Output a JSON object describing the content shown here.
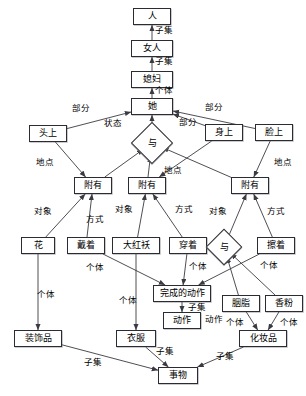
{
  "diagram": {
    "type": "semantic-network",
    "canvas": {
      "width": 306,
      "height": 396
    },
    "style": {
      "node_fill": "#ffffff",
      "node_stroke": "#2b2b33",
      "edge_stroke": "#3a3a42",
      "text_color": "#000000"
    },
    "nodes": [
      {
        "id": "ren",
        "label": "人",
        "shape": "rect",
        "x": 133,
        "y": 8,
        "w": 38,
        "h": 17
      },
      {
        "id": "nvren",
        "label": "女人",
        "shape": "rect",
        "x": 131,
        "y": 40,
        "w": 42,
        "h": 17
      },
      {
        "id": "xifu",
        "label": "媳妇",
        "shape": "rect",
        "x": 131,
        "y": 71,
        "w": 42,
        "h": 17
      },
      {
        "id": "ta",
        "label": "她",
        "shape": "rect",
        "x": 131,
        "y": 98,
        "w": 42,
        "h": 17
      },
      {
        "id": "touting",
        "label": "头上",
        "shape": "rect",
        "x": 29,
        "y": 125,
        "w": 38,
        "h": 17
      },
      {
        "id": "shenshang",
        "label": "身上",
        "shape": "rect",
        "x": 205,
        "y": 124,
        "w": 38,
        "h": 17
      },
      {
        "id": "lianshang",
        "label": "脸上",
        "shape": "rect",
        "x": 255,
        "y": 124,
        "w": 38,
        "h": 17
      },
      {
        "id": "yu1",
        "label": "与",
        "shape": "diamond",
        "x": 137,
        "y": 128,
        "w": 30,
        "h": 30
      },
      {
        "id": "fuyou1",
        "label": "附有",
        "shape": "rect",
        "x": 74,
        "y": 177,
        "w": 38,
        "h": 17
      },
      {
        "id": "fuyou2",
        "label": "附有",
        "shape": "rect",
        "x": 128,
        "y": 177,
        "w": 38,
        "h": 17
      },
      {
        "id": "fuyou3",
        "label": "附有",
        "shape": "rect",
        "x": 231,
        "y": 177,
        "w": 38,
        "h": 17
      },
      {
        "id": "hua",
        "label": "花",
        "shape": "rect",
        "x": 21,
        "y": 237,
        "w": 34,
        "h": 17
      },
      {
        "id": "daizhe",
        "label": "戴着",
        "shape": "rect",
        "x": 67,
        "y": 237,
        "w": 38,
        "h": 17
      },
      {
        "id": "dahongao",
        "label": "大红袄",
        "shape": "rect",
        "x": 112,
        "y": 237,
        "w": 48,
        "h": 17
      },
      {
        "id": "chuanzhe",
        "label": "穿着",
        "shape": "rect",
        "x": 169,
        "y": 237,
        "w": 38,
        "h": 17
      },
      {
        "id": "yu2",
        "label": "与",
        "shape": "diamond",
        "x": 211,
        "y": 234,
        "w": 26,
        "h": 26
      },
      {
        "id": "cazhe",
        "label": "擦着",
        "shape": "rect",
        "x": 257,
        "y": 237,
        "w": 38,
        "h": 17
      },
      {
        "id": "wanchengdongzuo",
        "label": "完成的动作",
        "shape": "rect",
        "x": 153,
        "y": 285,
        "w": 58,
        "h": 17
      },
      {
        "id": "yanzhi",
        "label": "胭脂",
        "shape": "rect",
        "x": 222,
        "y": 295,
        "w": 38,
        "h": 17
      },
      {
        "id": "xiangfen",
        "label": "香粉",
        "shape": "rect",
        "x": 265,
        "y": 295,
        "w": 38,
        "h": 17
      },
      {
        "id": "dongzuo",
        "label": "动作",
        "shape": "rect",
        "x": 163,
        "y": 312,
        "w": 38,
        "h": 17
      },
      {
        "id": "zhuangshipin",
        "label": "装饰品",
        "shape": "rect",
        "x": 14,
        "y": 330,
        "w": 48,
        "h": 17
      },
      {
        "id": "yifu",
        "label": "衣服",
        "shape": "rect",
        "x": 116,
        "y": 330,
        "w": 40,
        "h": 17
      },
      {
        "id": "huazhuangpin",
        "label": "化妆品",
        "shape": "rect",
        "x": 239,
        "y": 330,
        "w": 48,
        "h": 17
      },
      {
        "id": "shiwu",
        "label": "事物",
        "shape": "rect",
        "x": 158,
        "y": 367,
        "w": 40,
        "h": 17
      }
    ],
    "edges": [
      {
        "from": "nvren",
        "to": "ren",
        "label": "子集"
      },
      {
        "from": "xifu",
        "to": "nvren",
        "label": "子集"
      },
      {
        "from": "ta",
        "to": "xifu",
        "label": "个体"
      },
      {
        "from": "touting",
        "to": "ta",
        "label": "部分"
      },
      {
        "from": "shenshang",
        "to": "ta",
        "label": "部分"
      },
      {
        "from": "lianshang",
        "to": "ta",
        "label": "部分"
      },
      {
        "from": "yu1",
        "to": "ta",
        "label": "状态"
      },
      {
        "from": "fuyou1",
        "to": "yu1",
        "label": ""
      },
      {
        "from": "fuyou2",
        "to": "yu1",
        "label": ""
      },
      {
        "from": "fuyou3",
        "to": "yu1",
        "label": ""
      },
      {
        "from": "touting",
        "to": "fuyou1",
        "label": "地点"
      },
      {
        "from": "shenshang",
        "to": "fuyou2",
        "label": "地点"
      },
      {
        "from": "lianshang",
        "to": "fuyou3",
        "label": "地点"
      },
      {
        "from": "hua",
        "to": "fuyou1",
        "label": "对象"
      },
      {
        "from": "daizhe",
        "to": "fuyou1",
        "label": "方式"
      },
      {
        "from": "dahongao",
        "to": "fuyou2",
        "label": "对象"
      },
      {
        "from": "chuanzhe",
        "to": "fuyou2",
        "label": "方式"
      },
      {
        "from": "yu2",
        "to": "fuyou3",
        "label": "对象"
      },
      {
        "from": "cazhe",
        "to": "fuyou3",
        "label": "方式"
      },
      {
        "from": "hua",
        "to": "zhuangshipin",
        "label": "个体"
      },
      {
        "from": "daizhe",
        "to": "wanchengdongzuo",
        "label": "个体"
      },
      {
        "from": "dahongao",
        "to": "yifu",
        "label": "个体"
      },
      {
        "from": "chuanzhe",
        "to": "wanchengdongzuo",
        "label": "个体"
      },
      {
        "from": "cazhe",
        "to": "wanchengdongzuo",
        "label": "个体"
      },
      {
        "from": "yanzhi",
        "to": "yu2",
        "label": "个体"
      },
      {
        "from": "xiangfen",
        "to": "yu2",
        "label": "个体"
      },
      {
        "from": "yanzhi",
        "to": "huazhuangpin",
        "label": "个体"
      },
      {
        "from": "xiangfen",
        "to": "huazhuangpin",
        "label": "个体"
      },
      {
        "from": "wanchengdongzuo",
        "to": "dongzuo",
        "label": "子集"
      },
      {
        "from": "zhuangshipin",
        "to": "shiwu",
        "label": "子集"
      },
      {
        "from": "yifu",
        "to": "shiwu",
        "label": "子集"
      },
      {
        "from": "huazhuangpin",
        "to": "shiwu",
        "label": "子集"
      }
    ],
    "edge_labels": [
      {
        "text": "子集",
        "x": 155,
        "y": 26
      },
      {
        "text": "子集",
        "x": 155,
        "y": 57
      },
      {
        "text": "个体",
        "x": 155,
        "y": 86
      },
      {
        "text": "部分",
        "x": 72,
        "y": 104
      },
      {
        "text": "部分",
        "x": 205,
        "y": 103
      },
      {
        "text": "部分",
        "x": 179,
        "y": 118
      },
      {
        "text": "状态",
        "x": 104,
        "y": 119
      },
      {
        "text": "地点",
        "x": 36,
        "y": 158
      },
      {
        "text": "地点",
        "x": 164,
        "y": 166
      },
      {
        "text": "地点",
        "x": 274,
        "y": 158
      },
      {
        "text": "对象",
        "x": 34,
        "y": 207
      },
      {
        "text": "方式",
        "x": 86,
        "y": 215
      },
      {
        "text": "对象",
        "x": 115,
        "y": 205
      },
      {
        "text": "方式",
        "x": 175,
        "y": 205
      },
      {
        "text": "对象",
        "x": 209,
        "y": 207
      },
      {
        "text": "方式",
        "x": 267,
        "y": 207
      },
      {
        "text": "个体",
        "x": 37,
        "y": 290
      },
      {
        "text": "个体",
        "x": 86,
        "y": 263
      },
      {
        "text": "个体",
        "x": 119,
        "y": 296
      },
      {
        "text": "个体",
        "x": 189,
        "y": 262
      },
      {
        "text": "个体",
        "x": 260,
        "y": 261
      },
      {
        "text": "个体",
        "x": 226,
        "y": 318
      },
      {
        "text": "个体",
        "x": 280,
        "y": 318
      },
      {
        "text": "子集",
        "x": 188,
        "y": 303
      },
      {
        "text": "动作",
        "x": 205,
        "y": 315
      },
      {
        "text": "子集",
        "x": 84,
        "y": 358
      },
      {
        "text": "子集",
        "x": 156,
        "y": 347
      },
      {
        "text": "子集",
        "x": 216,
        "y": 352
      }
    ]
  }
}
